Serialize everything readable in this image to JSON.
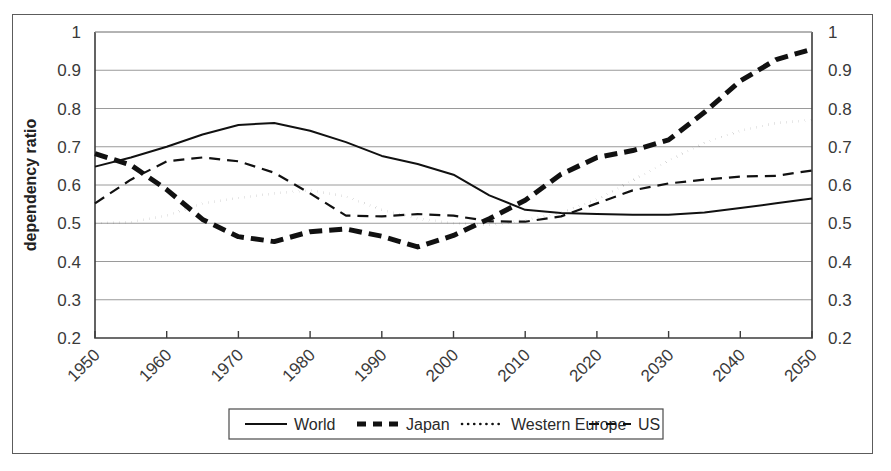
{
  "figure": {
    "border_color": "#5c5c5c",
    "background": "#ffffff"
  },
  "chart_data": {
    "type": "line",
    "title": "",
    "xlabel": "",
    "ylabel": "dependency ratio",
    "xlim": [
      1950,
      2050
    ],
    "ylim": [
      0.2,
      1
    ],
    "ytick_values": [
      0.2,
      0.3,
      0.4,
      0.5,
      0.6,
      0.7,
      0.8,
      0.9,
      1
    ],
    "ytick_labels": [
      "0.2",
      "0.3",
      "0.4",
      "0.5",
      "0.6",
      "0.7",
      "0.8",
      "0.9",
      "1"
    ],
    "xtick_values": [
      1950,
      1960,
      1970,
      1980,
      1990,
      2000,
      2010,
      2020,
      2030,
      2040,
      2050
    ],
    "xtick_labels": [
      "1950",
      "1960",
      "1970",
      "1980",
      "1990",
      "2000",
      "2010",
      "2020",
      "2030",
      "2040",
      "2050"
    ],
    "xtick_rotation": 45,
    "grid": "horizontal",
    "right_axis_mirror": true,
    "right_ytick_labels": [
      "0.2",
      "0.3",
      "0.4",
      "0.5",
      "0.6",
      "0.7",
      "0.8",
      "0.9",
      "1"
    ],
    "legend_position": "bottom",
    "legend_entries": [
      "World",
      "Japan",
      "Western Europe",
      "US"
    ],
    "x": [
      1950,
      1955,
      1960,
      1965,
      1970,
      1975,
      1980,
      1985,
      1990,
      1995,
      2000,
      2005,
      2010,
      2015,
      2020,
      2025,
      2030,
      2035,
      2040,
      2045,
      2050
    ],
    "series": [
      {
        "name": "World",
        "style": "solid",
        "color": "#111111",
        "width": 2.0,
        "values": [
          0.648,
          0.672,
          0.7,
          0.732,
          0.757,
          0.762,
          0.742,
          0.712,
          0.676,
          0.655,
          0.627,
          0.573,
          0.535,
          0.527,
          0.524,
          0.522,
          0.522,
          0.528,
          0.54,
          0.552,
          0.565
        ]
      },
      {
        "name": "Japan",
        "style": "dashed-thick",
        "color": "#111111",
        "width": 5.0,
        "values": [
          0.682,
          0.652,
          0.588,
          0.51,
          0.465,
          0.452,
          0.478,
          0.485,
          0.466,
          0.438,
          0.468,
          0.512,
          0.56,
          0.628,
          0.672,
          0.69,
          0.718,
          0.79,
          0.872,
          0.928,
          0.955
        ]
      },
      {
        "name": "Western Europe",
        "style": "dotted",
        "color": "#111111",
        "width": 2.6,
        "values": [
          0.5,
          0.503,
          0.52,
          0.552,
          0.566,
          0.578,
          0.586,
          0.57,
          0.535,
          0.512,
          0.5,
          0.495,
          0.508,
          0.528,
          0.562,
          0.612,
          0.664,
          0.71,
          0.742,
          0.762,
          0.77
        ]
      },
      {
        "name": "US",
        "style": "dashed",
        "color": "#111111",
        "width": 2.2,
        "values": [
          0.552,
          0.614,
          0.662,
          0.672,
          0.662,
          0.632,
          0.578,
          0.52,
          0.518,
          0.524,
          0.52,
          0.505,
          0.504,
          0.518,
          0.552,
          0.586,
          0.604,
          0.614,
          0.622,
          0.624,
          0.638
        ]
      }
    ]
  },
  "legend": {
    "items": [
      {
        "label": "World",
        "style": "solid"
      },
      {
        "label": "Japan",
        "style": "dashed-thick"
      },
      {
        "label": "Western Europe",
        "style": "dotted"
      },
      {
        "label": "US",
        "style": "dashed"
      }
    ]
  }
}
